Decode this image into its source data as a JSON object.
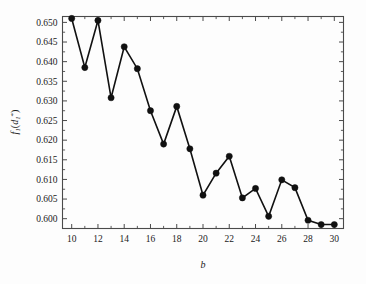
{
  "figure": {
    "background_color": "#fdfdfd",
    "line_color": "#111111",
    "marker_color": "#111111",
    "axis_color": "#4a4a4a"
  },
  "axes": {
    "x_title": "b",
    "y_title_f": "f",
    "y_title_sub1": "1",
    "y_title_open": "(",
    "y_title_d": "d",
    "y_title_sub2": "1",
    "y_title_star": "*",
    "y_title_close": ")",
    "x_ticklabels": [
      "10",
      "12",
      "14",
      "16",
      "18",
      "20",
      "22",
      "24",
      "26",
      "28",
      "30"
    ],
    "y_ticklabels": [
      "0.650",
      "0.645",
      "0.640",
      "0.635",
      "0.630",
      "0.625",
      "0.620",
      "0.615",
      "0.610",
      "0.605",
      "0.600"
    ]
  },
  "chart_data": {
    "type": "line",
    "title": "",
    "subtitle": "",
    "xlabel": "b",
    "ylabel": "f_1(d_1^*)",
    "xlim": [
      9.3,
      30.7
    ],
    "ylim": [
      0.5975,
      0.6515
    ],
    "xticks": [
      10,
      12,
      14,
      16,
      18,
      20,
      22,
      24,
      26,
      28,
      30
    ],
    "xticks_minor": [
      11,
      13,
      15,
      17,
      19,
      21,
      23,
      25,
      27,
      29
    ],
    "yticks": [
      0.6,
      0.605,
      0.61,
      0.615,
      0.62,
      0.625,
      0.63,
      0.635,
      0.64,
      0.645,
      0.65
    ],
    "grid": false,
    "legend": null,
    "marker": "filled-circle",
    "x": [
      10,
      11,
      12,
      13,
      14,
      15,
      16,
      17,
      18,
      19,
      20,
      21,
      22,
      23,
      24,
      25,
      26,
      27,
      28,
      29,
      30
    ],
    "values": [
      0.651,
      0.6385,
      0.6505,
      0.6308,
      0.6438,
      0.6382,
      0.6275,
      0.619,
      0.6286,
      0.6178,
      0.606,
      0.6116,
      0.6159,
      0.6053,
      0.6077,
      0.6006,
      0.6099,
      0.6079,
      0.5996,
      0.5985,
      0.5985
    ],
    "series": [
      {
        "name": "f1(d1*)",
        "values": [
          0.651,
          0.6385,
          0.6505,
          0.6308,
          0.6438,
          0.6382,
          0.6275,
          0.619,
          0.6286,
          0.6178,
          0.606,
          0.6116,
          0.6159,
          0.6053,
          0.6077,
          0.6006,
          0.6099,
          0.6079,
          0.5996,
          0.5985,
          0.5985
        ]
      }
    ]
  }
}
